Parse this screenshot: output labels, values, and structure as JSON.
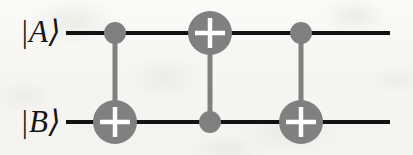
{
  "figure": {
    "name": "swap-gate-circuit",
    "background_color": "#f8f7f5",
    "width": 413,
    "height": 155
  },
  "wires": {
    "line_color": "#121212",
    "line_width": 4,
    "x_start": 66,
    "x_end": 390,
    "list": [
      {
        "id": "wire-a",
        "label": "|A⟩",
        "y": 33
      },
      {
        "id": "wire-b",
        "label": "|B⟩",
        "y": 122
      }
    ]
  },
  "gates": {
    "gate_color": "#808080",
    "plus_color": "#ffffff",
    "control_radius": 11,
    "target_radius": 22,
    "connector_width": 5,
    "plus_arm_length": 15,
    "plus_thickness": 4,
    "list": [
      {
        "id": "cnot-1",
        "type": "CNOT",
        "x": 115,
        "control_wire": "wire-a",
        "control_y": 33,
        "target_wire": "wire-b",
        "target_y": 122,
        "symbol": "⊕"
      },
      {
        "id": "cnot-2",
        "type": "CNOT",
        "x": 210,
        "control_wire": "wire-b",
        "control_y": 122,
        "target_wire": "wire-a",
        "target_y": 33,
        "symbol": "⊕"
      },
      {
        "id": "cnot-3",
        "type": "CNOT",
        "x": 301,
        "control_wire": "wire-a",
        "control_y": 33,
        "target_wire": "wire-b",
        "target_y": 122,
        "symbol": "⊕"
      }
    ]
  }
}
